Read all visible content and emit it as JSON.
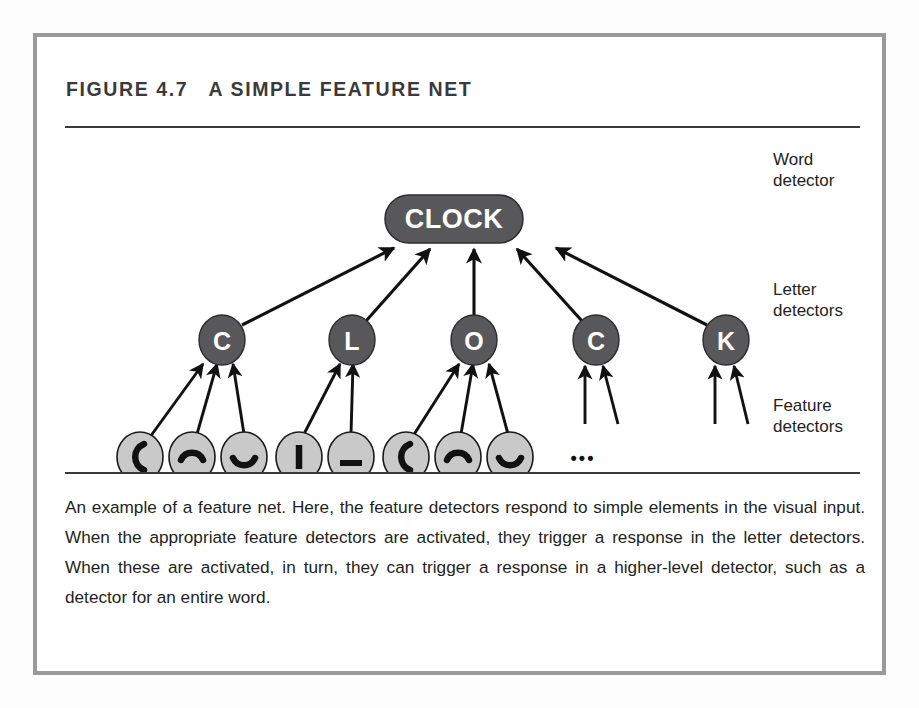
{
  "figure": {
    "label": "FIGURE 4.7",
    "title": "A SIMPLE FEATURE NET",
    "caption": "An example of a feature net. Here, the feature detectors respond to simple elements in the visual input. When the appropriate feature detectors are activated, they trigger a response in the letter detectors. When these are activated, in turn, they can trigger a response in a higher-level detector, such as a detector for an entire word."
  },
  "colors": {
    "frame_border": "#9a9a9c",
    "rule": "#3b3b3d",
    "node_dark": "#58585a",
    "node_light": "#c9c9c9",
    "node_stroke": "#1a1a1a",
    "text_dark": "#231f20",
    "node_text_light": "#ffffff",
    "arrow": "#111111",
    "page_bg": "#ffffff"
  },
  "diagram": {
    "type": "hierarchical-network",
    "levels": [
      {
        "key": "word",
        "label": "Word\ndetector"
      },
      {
        "key": "letter",
        "label": "Letter\ndetectors"
      },
      {
        "key": "feature",
        "label": "Feature\ndetectors"
      }
    ],
    "word_node": {
      "text": "CLOCK",
      "shape": "rounded-pill",
      "cx": 417,
      "cy": 87,
      "rx": 69,
      "ry": 24,
      "fill": "#58585a",
      "text_color": "#ffffff"
    },
    "letter_nodes": [
      {
        "id": "letter-c1",
        "text": "C",
        "cx": 185,
        "cy": 208,
        "r": 23
      },
      {
        "id": "letter-l",
        "text": "L",
        "cx": 315,
        "cy": 208,
        "r": 23
      },
      {
        "id": "letter-o",
        "text": "O",
        "cx": 437,
        "cy": 208,
        "r": 23
      },
      {
        "id": "letter-c2",
        "text": "C",
        "cx": 559,
        "cy": 208,
        "r": 23
      },
      {
        "id": "letter-k",
        "text": "K",
        "cx": 689,
        "cy": 208,
        "r": 23
      }
    ],
    "feature_nodes": [
      {
        "id": "feature-1",
        "glyph": "left-curve",
        "cx": 103,
        "cy": 325,
        "r": 23
      },
      {
        "id": "feature-2",
        "glyph": "arc-up",
        "cx": 155,
        "cy": 325,
        "r": 23
      },
      {
        "id": "feature-3",
        "glyph": "arc-down",
        "cx": 207,
        "cy": 325,
        "r": 23
      },
      {
        "id": "feature-4",
        "glyph": "vertical-bar",
        "cx": 262,
        "cy": 325,
        "r": 23
      },
      {
        "id": "feature-5",
        "glyph": "horizontal-bar",
        "cx": 314,
        "cy": 325,
        "r": 23
      },
      {
        "id": "feature-6",
        "glyph": "left-curve",
        "cx": 369,
        "cy": 325,
        "r": 23
      },
      {
        "id": "feature-7",
        "glyph": "arc-up",
        "cx": 421,
        "cy": 325,
        "r": 23
      },
      {
        "id": "feature-8",
        "glyph": "arc-down",
        "cx": 473,
        "cy": 325,
        "r": 23
      }
    ],
    "ellipsis": {
      "text": "•••",
      "cx": 546,
      "cy": 325
    },
    "edges_letter_to_word": [
      {
        "from": "letter-c1",
        "to": "word_node"
      },
      {
        "from": "letter-l",
        "to": "word_node"
      },
      {
        "from": "letter-o",
        "to": "word_node"
      },
      {
        "from": "letter-c2",
        "to": "word_node"
      },
      {
        "from": "letter-k",
        "to": "word_node"
      }
    ],
    "edges_feature_to_letter": [
      {
        "from": "feature-1",
        "to": "letter-c1"
      },
      {
        "from": "feature-2",
        "to": "letter-c1"
      },
      {
        "from": "feature-3",
        "to": "letter-c1"
      },
      {
        "from": "feature-4",
        "to": "letter-l"
      },
      {
        "from": "feature-5",
        "to": "letter-l"
      },
      {
        "from": "feature-6",
        "to": "letter-o"
      },
      {
        "from": "feature-7",
        "to": "letter-o"
      },
      {
        "from": "feature-8",
        "to": "letter-o"
      }
    ],
    "stub_edges": [
      {
        "to": "letter-c2",
        "count": 2
      },
      {
        "to": "letter-k",
        "count": 2
      }
    ]
  }
}
